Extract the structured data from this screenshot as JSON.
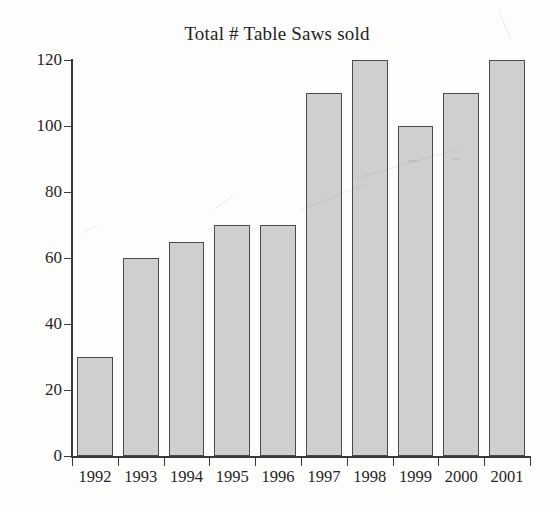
{
  "chart_data": {
    "type": "bar",
    "title": "Total # Table Saws sold",
    "xlabel": "",
    "ylabel": "",
    "categories": [
      "1992",
      "1993",
      "1994",
      "1995",
      "1996",
      "1997",
      "1998",
      "1999",
      "2000",
      "2001"
    ],
    "values": [
      30,
      60,
      65,
      70,
      70,
      110,
      120,
      100,
      110,
      120
    ],
    "ylim": [
      0,
      120
    ],
    "ytick_labels": [
      "0",
      "20",
      "40",
      "60",
      "80",
      "100",
      "120"
    ],
    "ytick_values": [
      0,
      20,
      40,
      60,
      80,
      100,
      120
    ],
    "grid": false,
    "legend": false,
    "legend_position": "none",
    "bar_fill_color": "#cfcfcf",
    "bar_border_color": "#4a4a4a",
    "axis_color": "#3a3a3a",
    "background_color": "#fdfdfc",
    "text_color": "#262626"
  }
}
